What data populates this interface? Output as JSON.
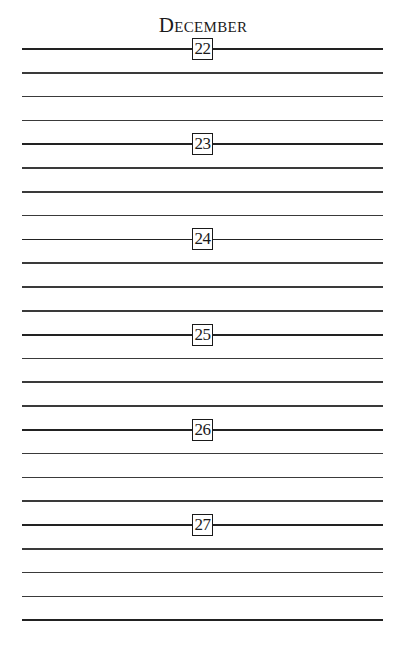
{
  "page": {
    "month": "December",
    "days": [
      {
        "date": "22"
      },
      {
        "date": "23"
      },
      {
        "date": "24"
      },
      {
        "date": "25"
      },
      {
        "date": "26"
      },
      {
        "date": "27"
      }
    ],
    "lines_per_day": 4,
    "colors": {
      "ink": "#1a1a1a",
      "rule": "#3a3a3a",
      "paper": "#ffffff"
    }
  }
}
